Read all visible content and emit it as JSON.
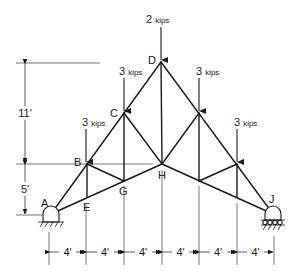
{
  "diagram": {
    "type": "roof-truss",
    "nodes": {
      "A": {
        "label": "A",
        "x": 51,
        "y": 214
      },
      "B": {
        "label": "B",
        "x": 87,
        "y": 164
      },
      "C": {
        "label": "C",
        "x": 124,
        "y": 113
      },
      "D": {
        "label": "D",
        "x": 161,
        "y": 62
      },
      "E": {
        "label": "E",
        "x": 87,
        "y": 197
      },
      "G": {
        "label": "G",
        "x": 124,
        "y": 181
      },
      "H": {
        "label": "H",
        "x": 162,
        "y": 164
      },
      "J": {
        "label": "J",
        "x": 273,
        "y": 214
      },
      "Cr": {
        "label": "",
        "x": 199,
        "y": 113
      },
      "Br": {
        "label": "",
        "x": 237,
        "y": 164
      },
      "Gr": {
        "label": "",
        "x": 199,
        "y": 181
      },
      "Er": {
        "label": "",
        "x": 237,
        "y": 197
      }
    },
    "loads": [
      {
        "node": "B",
        "value": "3",
        "unit": "kips"
      },
      {
        "node": "C",
        "value": "3",
        "unit": "kips"
      },
      {
        "node": "D",
        "value": "2",
        "unit": "kips"
      },
      {
        "node": "Cr",
        "value": "3",
        "unit": "kips"
      },
      {
        "node": "Br",
        "value": "3",
        "unit": "kips"
      }
    ],
    "vertical_dimensions": [
      {
        "label": "11'",
        "from": "D",
        "to": "H"
      },
      {
        "label": "5'",
        "from": "B",
        "to": "A"
      }
    ],
    "horizontal_dimensions": [
      {
        "label": "4'"
      },
      {
        "label": "4'"
      },
      {
        "label": "4'"
      },
      {
        "label": "4'"
      },
      {
        "label": "4'"
      },
      {
        "label": "4'"
      }
    ],
    "supports": {
      "A": "pin",
      "J": "roller"
    }
  }
}
